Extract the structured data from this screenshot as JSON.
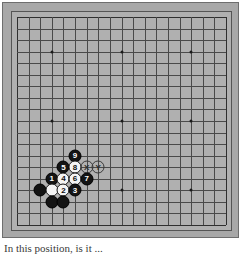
{
  "diagram": {
    "type": "go-board-diagram",
    "board_size": 19,
    "caption": "In this position, is it ...",
    "colors": {
      "board_background": "#b0b0b0",
      "frame_background": "#a8a8a8",
      "grid_line": "#4a4a4a",
      "edge_line": "#2f2f2f",
      "black_stone": "#141414",
      "white_stone": "#f4f4f4",
      "marker_outline": "#3a3a3a"
    }
  },
  "board": {
    "star_points": [
      {
        "col": 3,
        "row": 3
      },
      {
        "col": 9,
        "row": 3
      },
      {
        "col": 15,
        "row": 3
      },
      {
        "col": 3,
        "row": 9
      },
      {
        "col": 9,
        "row": 9
      },
      {
        "col": 15,
        "row": 9
      },
      {
        "col": 3,
        "row": 15
      },
      {
        "col": 9,
        "row": 15
      },
      {
        "col": 15,
        "row": 15
      }
    ],
    "stones": [
      {
        "label": "9",
        "color": "black",
        "col": 5,
        "row": 12
      },
      {
        "label": "5",
        "color": "black",
        "col": 4,
        "row": 13
      },
      {
        "label": "8",
        "color": "white",
        "col": 5,
        "row": 13
      },
      {
        "label": "X",
        "color": "marker",
        "col": 6,
        "row": 13
      },
      {
        "label": "Y",
        "color": "marker",
        "col": 7,
        "row": 13
      },
      {
        "label": "1",
        "color": "black",
        "col": 3,
        "row": 14
      },
      {
        "label": "4",
        "color": "white",
        "col": 4,
        "row": 14
      },
      {
        "label": "6",
        "color": "white",
        "col": 5,
        "row": 14
      },
      {
        "label": "7",
        "color": "black",
        "col": 6,
        "row": 14
      },
      {
        "label": "",
        "color": "black",
        "col": 2,
        "row": 15
      },
      {
        "label": "",
        "color": "white",
        "col": 3,
        "row": 15
      },
      {
        "label": "2",
        "color": "white",
        "col": 4,
        "row": 15
      },
      {
        "label": "3",
        "color": "black",
        "col": 5,
        "row": 15
      },
      {
        "label": "",
        "color": "black",
        "col": 3,
        "row": 16
      },
      {
        "label": "",
        "color": "black",
        "col": 4,
        "row": 16
      }
    ]
  }
}
